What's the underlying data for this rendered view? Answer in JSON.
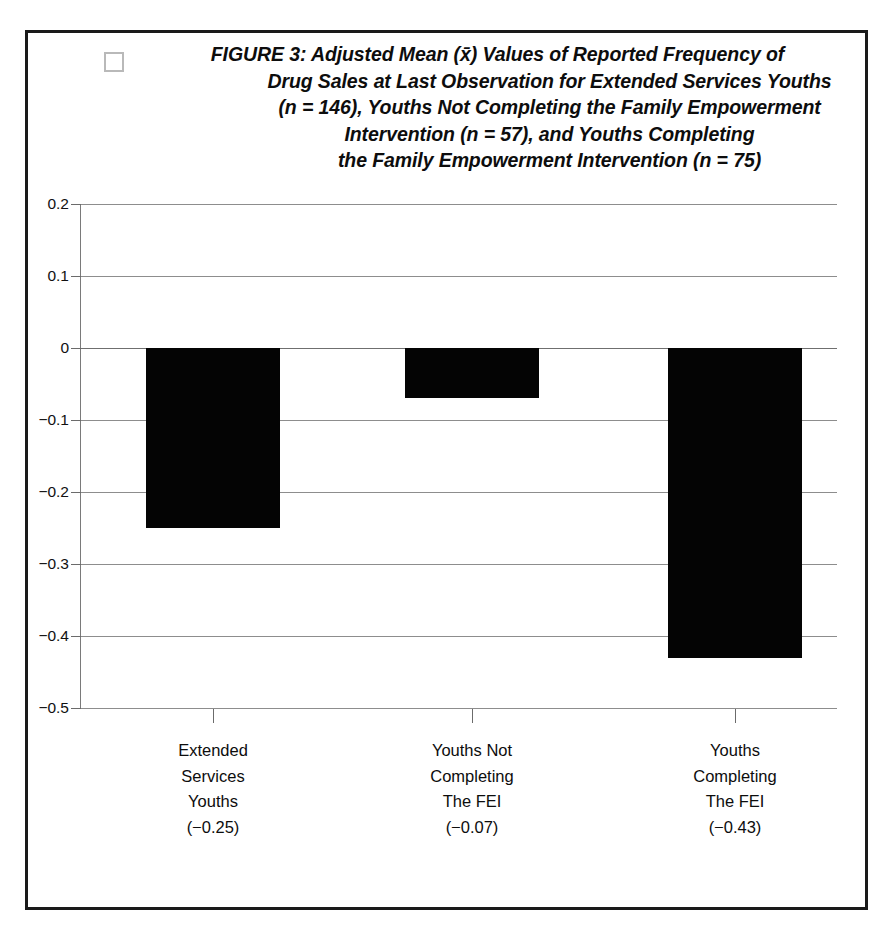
{
  "figure": {
    "bullet_icon": "empty-checkbox-icon",
    "title_lines": [
      "FIGURE 3: Adjusted Mean (x̄) Values of Reported Frequency of",
      "Drug Sales at Last Observation for Extended Services Youths",
      "(n = 146), Youths Not Completing the Family Empowerment",
      "Intervention (n = 57), and Youths Completing",
      "the  Family Empowerment Intervention  (n = 75)"
    ]
  },
  "chart_data": {
    "type": "bar",
    "xlabel": "",
    "ylabel": "",
    "categories": [
      "Extended Services Youths",
      "Youths Not Completing The FEI",
      "Youths Completing The FEI"
    ],
    "category_label_lines": [
      [
        "Extended",
        "Services",
        "Youths",
        "(−0.25)"
      ],
      [
        "Youths Not",
        "Completing",
        "The FEI",
        "(−0.07)"
      ],
      [
        "Youths",
        "Completing",
        "The FEI",
        "(−0.43)"
      ]
    ],
    "values": [
      -0.25,
      -0.07,
      -0.43
    ],
    "value_labels": [
      "(−0.25)",
      "(−0.07)",
      "(−0.43)"
    ],
    "ylim": [
      -0.5,
      0.2
    ],
    "ytick_values": [
      0.2,
      0.1,
      0,
      -0.1,
      -0.2,
      -0.3,
      -0.4,
      -0.5
    ],
    "ytick_labels": [
      "0.2",
      "0.1",
      "0",
      "−0.1",
      "−0.2",
      "−0.3",
      "−0.4",
      "−0.5"
    ],
    "grid": true,
    "legend": false,
    "bar_color": "#040404",
    "gridline_color": "#8d8d8d",
    "sample_sizes": {
      "extended_services_youths": 146,
      "youths_not_completing_fei": 57,
      "youths_completing_fei": 75
    }
  }
}
